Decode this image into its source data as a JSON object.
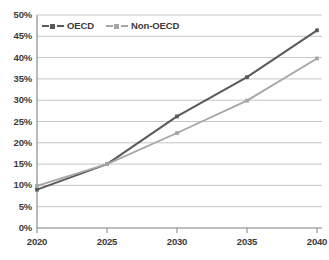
{
  "chart_data": {
    "type": "line",
    "title": "",
    "xlabel": "",
    "ylabel": "",
    "x": [
      2020,
      2025,
      2030,
      2035,
      2040
    ],
    "categories": [
      "2020",
      "2025",
      "2030",
      "2035",
      "2040"
    ],
    "series": [
      {
        "name": "OECD",
        "values": [
          9.0,
          15.0,
          26.2,
          35.4,
          46.4
        ],
        "color": "#595959"
      },
      {
        "name": "Non-OECD",
        "values": [
          9.9,
          15.0,
          22.3,
          29.9,
          39.8
        ],
        "color": "#a6a6a6"
      }
    ],
    "ylim": [
      0,
      50
    ],
    "xlim": [
      2020,
      2040
    ],
    "yticks": [
      "0%",
      "5%",
      "10%",
      "15%",
      "20%",
      "25%",
      "30%",
      "35%",
      "40%",
      "45%",
      "50%"
    ],
    "ytick_values": [
      0,
      5,
      10,
      15,
      20,
      25,
      30,
      35,
      40,
      45,
      50
    ],
    "xticks": [
      "2020",
      "2025",
      "2030",
      "2035",
      "2040"
    ],
    "grid": true,
    "grid_axis": "y",
    "legend_position": "top-left",
    "value_suffix": "%"
  },
  "legend": {
    "items": [
      {
        "label": "OECD"
      },
      {
        "label": "Non-OECD"
      }
    ]
  },
  "colors": {
    "grid": "#bfbfbf",
    "axis": "#808080",
    "text": "#3b3b3b",
    "series_oecd": "#595959",
    "series_non_oecd": "#a6a6a6",
    "background": "#ffffff"
  }
}
